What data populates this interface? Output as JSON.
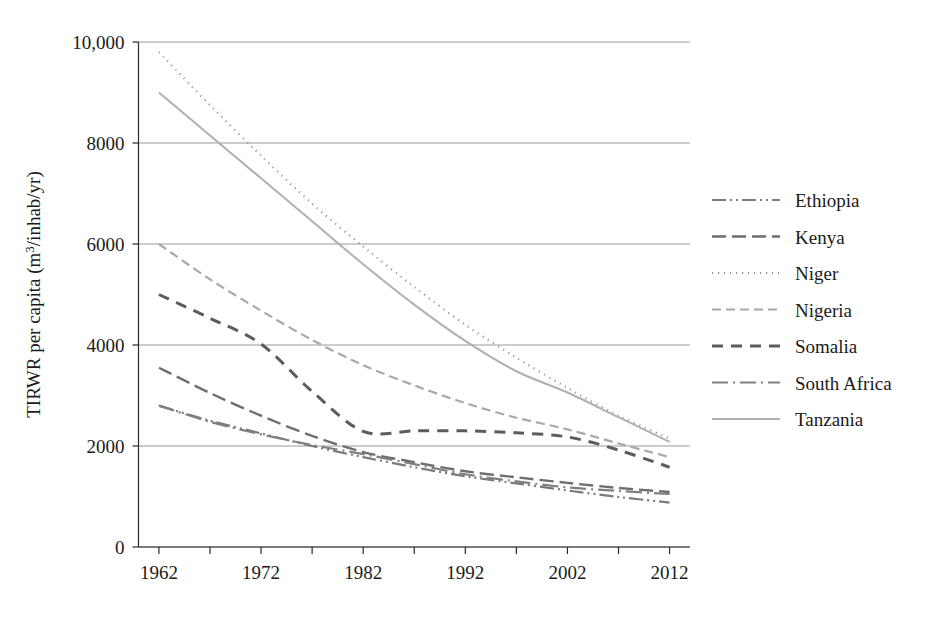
{
  "chart_data": {
    "type": "line",
    "title": "",
    "xlabel": "",
    "ylabel": "TIRWR per capita (m³/inhab/yr)",
    "ylabel_parts": {
      "prefix": "TIRWR per capita (m",
      "superscript": "3",
      "suffix": "/inhab/yr)"
    },
    "x": [
      1962,
      1967,
      1972,
      1977,
      1982,
      1987,
      1992,
      1997,
      2002,
      2007,
      2012
    ],
    "xlim": [
      1960,
      2014
    ],
    "ylim": [
      0,
      10000
    ],
    "yticks": [
      0,
      2000,
      4000,
      6000,
      8000,
      10000
    ],
    "ytick_labels": [
      "0",
      "2000",
      "4000",
      "6000",
      "8000",
      "10,000"
    ],
    "xticks": [
      1962,
      1967,
      1972,
      1977,
      1982,
      1987,
      1992,
      1997,
      2002,
      2007,
      2012
    ],
    "xtick_labels": [
      "1962",
      "",
      "1972",
      "",
      "1982",
      "",
      "1992",
      "",
      "2002",
      "",
      "2012"
    ],
    "xtick_labels_shown": [
      "1962",
      "1972",
      "1982",
      "1992",
      "2002",
      "2012"
    ],
    "grid": true,
    "grid_axis": "y",
    "legend_position": "right",
    "series": [
      {
        "name": "Ethiopia",
        "style": "dash-dot-dot",
        "color": "#7a7a7a",
        "width": 2.2,
        "dasharray": "14,4,2,4,2,4",
        "values": [
          2800,
          2500,
          2250,
          2000,
          1780,
          1580,
          1400,
          1260,
          1120,
          990,
          880
        ]
      },
      {
        "name": "Kenya",
        "style": "long-dash",
        "color": "#6e6e6e",
        "width": 2.4,
        "dasharray": "14,6",
        "values": [
          3550,
          3050,
          2600,
          2200,
          1880,
          1680,
          1500,
          1380,
          1270,
          1170,
          1090
        ]
      },
      {
        "name": "Niger",
        "style": "dotted",
        "color": "#8c8c8c",
        "width": 2.2,
        "dasharray": "1,5",
        "values": [
          9800,
          8750,
          7750,
          6800,
          5950,
          5150,
          4400,
          3750,
          3150,
          2600,
          2150
        ]
      },
      {
        "name": "Nigeria",
        "style": "dash",
        "color": "#a8a8a8",
        "width": 2.2,
        "dasharray": "9,5",
        "values": [
          6000,
          5300,
          4680,
          4100,
          3600,
          3200,
          2850,
          2560,
          2330,
          2050,
          1780
        ]
      },
      {
        "name": "Somalia",
        "style": "bold-dash",
        "color": "#5c5c5c",
        "width": 3.0,
        "dasharray": "11,8",
        "values": [
          5000,
          4530,
          4020,
          3080,
          2290,
          2300,
          2300,
          2260,
          2180,
          1920,
          1580
        ]
      },
      {
        "name": "South Africa",
        "style": "dash-dot",
        "color": "#7f7f7f",
        "width": 2.2,
        "dasharray": "16,5,2,5",
        "values": [
          2800,
          2480,
          2230,
          2020,
          1840,
          1640,
          1440,
          1300,
          1180,
          1110,
          1050
        ]
      },
      {
        "name": "Tanzania",
        "style": "solid",
        "color": "#b0b0b0",
        "width": 2.0,
        "dasharray": "none",
        "values": [
          9000,
          8150,
          7300,
          6450,
          5600,
          4800,
          4080,
          3480,
          3060,
          2570,
          2080
        ]
      }
    ],
    "colors": {
      "axis": "#2a2a2a",
      "grid": "#9a9a9a",
      "text": "#1a1a1a",
      "background": "#ffffff"
    }
  },
  "legend": {
    "items": [
      {
        "label": "Ethiopia"
      },
      {
        "label": "Kenya"
      },
      {
        "label": "Niger"
      },
      {
        "label": "Nigeria"
      },
      {
        "label": "Somalia"
      },
      {
        "label": "South Africa"
      },
      {
        "label": "Tanzania"
      }
    ]
  }
}
